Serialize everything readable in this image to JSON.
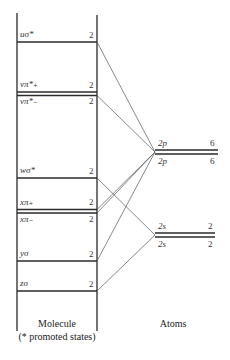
{
  "diagram": {
    "molecule": {
      "caption": "Molecule",
      "subcaption": "(* promoted states)",
      "levels": [
        {
          "label": "uσ*",
          "occupancy": "2",
          "y": 42,
          "target": "2p"
        },
        {
          "label": "vπ*₊",
          "occupancy": "2",
          "y": 92,
          "target": "2p"
        },
        {
          "label": "vπ*₋",
          "occupancy": "2",
          "y": 95,
          "target": "2p"
        },
        {
          "label": "wσ*",
          "occupancy": "2",
          "y": 178,
          "target": "2s"
        },
        {
          "label": "xπ₊",
          "occupancy": "2",
          "y": 210,
          "target": "2p"
        },
        {
          "label": "xπ₋",
          "occupancy": "2",
          "y": 213,
          "target": "2p"
        },
        {
          "label": "yσ",
          "occupancy": "2",
          "y": 261,
          "target": "2p"
        },
        {
          "label": "zσ",
          "occupancy": "2",
          "y": 291,
          "target": "2s"
        }
      ]
    },
    "atoms": {
      "caption": "Atoms",
      "levels": [
        {
          "id": "2p",
          "upper_label": "2p",
          "lower_label": "2p",
          "upper_occupancy": "6",
          "lower_occupancy": "6",
          "y": 152
        },
        {
          "id": "2s",
          "upper_label": "2s",
          "lower_label": "2s",
          "upper_occupancy": "2",
          "lower_occupancy": "2",
          "y": 235
        }
      ]
    },
    "colors": {
      "line": "#2a2a2a",
      "connector": "#555555"
    }
  }
}
